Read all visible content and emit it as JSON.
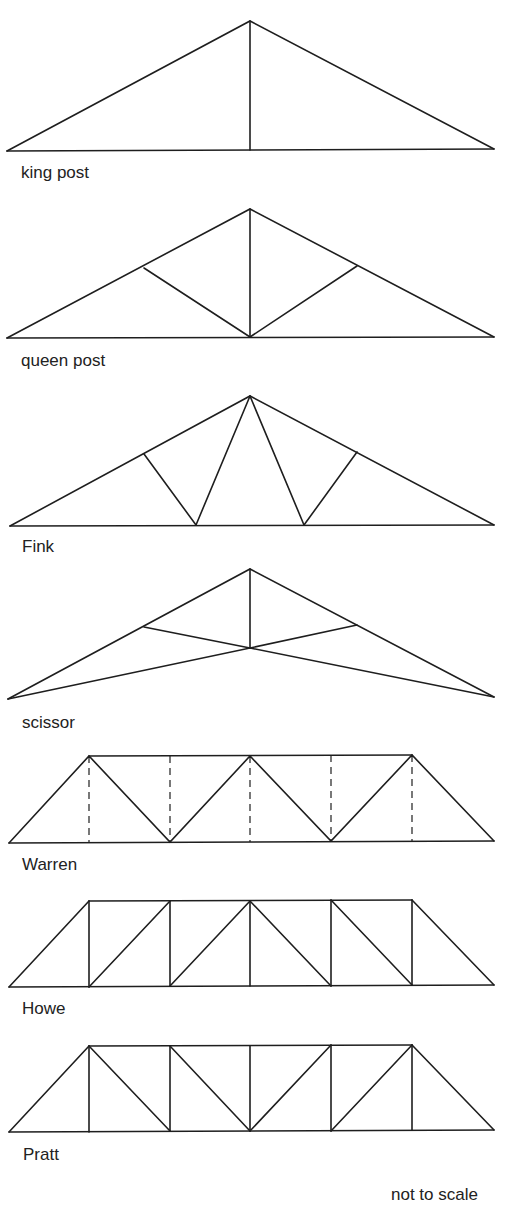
{
  "figure": {
    "note": "not to scale",
    "line_color": "#1e1e1e",
    "trusses": [
      {
        "name": "king post",
        "type": "pitched"
      },
      {
        "name": "queen post",
        "type": "pitched"
      },
      {
        "name": "Fink",
        "type": "pitched"
      },
      {
        "name": "scissor",
        "type": "pitched"
      },
      {
        "name": "Warren",
        "type": "parallel-chord",
        "note": "dashed verticals optional"
      },
      {
        "name": "Howe",
        "type": "parallel-chord"
      },
      {
        "name": "Pratt",
        "type": "parallel-chord"
      }
    ]
  }
}
